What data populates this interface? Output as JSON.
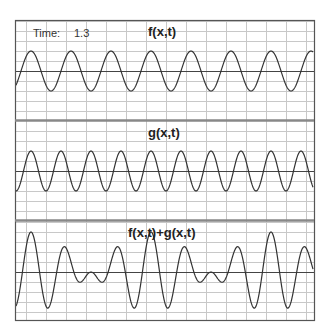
{
  "time": {
    "label": "Time:",
    "value": "1.3"
  },
  "panels": [
    {
      "title": "f(x,t)",
      "top": 20,
      "bottom": 120,
      "center": 71
    },
    {
      "title": "g(x,t)",
      "top": 121,
      "bottom": 220,
      "center": 171
    },
    {
      "title": "f(x,t)+g(x,t)",
      "top": 221,
      "bottom": 321,
      "center": 272
    }
  ],
  "frame": {
    "left": 15,
    "right": 314
  },
  "colors": {
    "grid": "#c8c8c8",
    "axis": "#444444",
    "curve": "#333333",
    "border": "#555555",
    "divider": "#888888"
  },
  "chart_data": {
    "type": "line",
    "grid": true,
    "x_range_px": [
      16,
      313
    ],
    "series": [
      {
        "name": "f(x,t)",
        "amplitude_px": 20,
        "period_px": 40,
        "peak_x": 31
      },
      {
        "name": "g(x,t)",
        "amplitude_px": 20,
        "period_px": 30,
        "peak_x": 31
      },
      {
        "name": "f(x,t)+g(x,t)",
        "sum_of": [
          "f(x,t)",
          "g(x,t)"
        ]
      }
    ],
    "annotations": [
      "Time: 1.3"
    ]
  }
}
